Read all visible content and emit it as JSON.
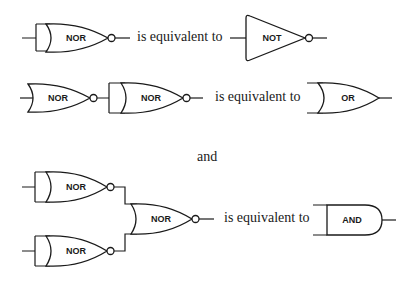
{
  "diagram": {
    "rows": [
      {
        "left_gates": [
          {
            "label": "NOR",
            "inputs": "tied"
          }
        ],
        "connector": "is equivalent to",
        "right_gate": {
          "label": "NOT"
        }
      },
      {
        "left_gates": [
          {
            "label": "NOR",
            "inputs": "single"
          },
          {
            "label": "NOR",
            "inputs": "tied"
          }
        ],
        "connector": "is equivalent to",
        "right_gate": {
          "label": "OR"
        }
      },
      {
        "left_gates": [
          {
            "label": "NOR",
            "inputs": "tied"
          },
          {
            "label": "NOR",
            "inputs": "tied"
          },
          {
            "label": "NOR",
            "inputs": "two"
          }
        ],
        "connector": "is equivalent to",
        "right_gate": {
          "label": "AND"
        }
      }
    ],
    "separator": "and"
  },
  "colors": {
    "ink": "#1a1a1a",
    "background": "#ffffff"
  }
}
